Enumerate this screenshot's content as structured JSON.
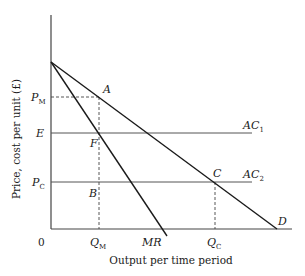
{
  "diagram": {
    "type": "economics-monopoly-vs-competition",
    "axes": {
      "y_label": "Price, cost per unit (£)",
      "x_label": "Output per time period",
      "origin_label": "0"
    },
    "y_ticks": [
      {
        "id": "pm",
        "main": "P",
        "sub": "M"
      },
      {
        "id": "e",
        "main": "E",
        "sub": ""
      },
      {
        "id": "pc",
        "main": "P",
        "sub": "C"
      }
    ],
    "x_ticks": [
      {
        "id": "qm",
        "main": "Q",
        "sub": "M"
      },
      {
        "id": "mr",
        "main": "MR",
        "sub": ""
      },
      {
        "id": "qc",
        "main": "Q",
        "sub": "C"
      }
    ],
    "curves": [
      {
        "id": "D",
        "label": "D",
        "description": "Demand curve"
      },
      {
        "id": "MR",
        "label": "MR",
        "description": "Marginal revenue curve"
      },
      {
        "id": "AC1",
        "main": "AC",
        "sub": "1",
        "description": "Average cost 1 (horizontal at E)"
      },
      {
        "id": "AC2",
        "main": "AC",
        "sub": "2",
        "description": "Average cost 2 (horizontal at P_C)"
      }
    ],
    "points": [
      {
        "id": "A",
        "label": "A"
      },
      {
        "id": "F",
        "label": "F"
      },
      {
        "id": "B",
        "label": "B"
      },
      {
        "id": "C",
        "label": "C"
      }
    ],
    "colors": {
      "line": "#1a1a1a",
      "grid_line": "#555555",
      "dashed": "#444444"
    }
  }
}
